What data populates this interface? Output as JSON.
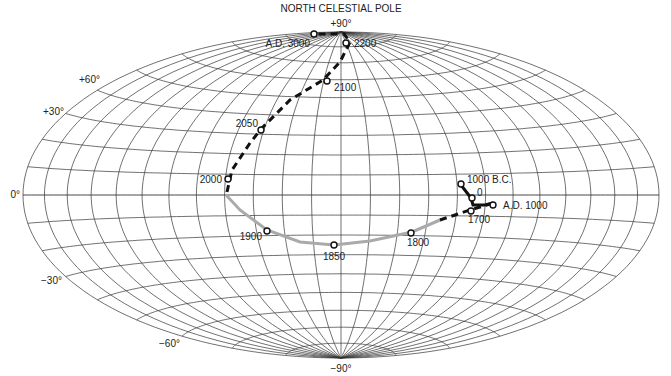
{
  "title": "NORTH CELESTIAL POLE",
  "projection": {
    "cx": 341,
    "cy": 195,
    "rx": 318,
    "ry": 163,
    "lat_step": 10,
    "lon_step": 15
  },
  "lat_labels": [
    {
      "text": "+90°",
      "x": 341,
      "y": 27,
      "anchor": "middle"
    },
    {
      "text": "+60°",
      "x": 100,
      "y": 83,
      "anchor": "end"
    },
    {
      "text": "+30°",
      "x": 64,
      "y": 115,
      "anchor": "end"
    },
    {
      "text": "0°",
      "x": 20,
      "y": 198,
      "anchor": "end"
    },
    {
      "text": "−30°",
      "x": 62,
      "y": 284,
      "anchor": "end"
    },
    {
      "text": "−60°",
      "x": 180,
      "y": 347,
      "anchor": "end"
    },
    {
      "text": "−90°",
      "x": 341,
      "y": 372,
      "anchor": "middle"
    }
  ],
  "path": {
    "gray_solid": [
      [
        227,
        196
      ],
      [
        240,
        210
      ],
      [
        267,
        230
      ],
      [
        300,
        242
      ],
      [
        334,
        245
      ],
      [
        370,
        241
      ],
      [
        412,
        232
      ],
      [
        440,
        220
      ]
    ],
    "dashed_lower": [
      [
        440,
        220
      ],
      [
        470,
        210
      ],
      [
        490,
        204
      ]
    ],
    "bc_segment": [
      [
        461,
        185
      ],
      [
        471,
        198
      ],
      [
        473,
        205
      ],
      [
        485,
        205
      ],
      [
        493,
        203
      ]
    ],
    "dashed_upper": [
      [
        227,
        192
      ],
      [
        232,
        170
      ],
      [
        250,
        143
      ],
      [
        262,
        128
      ],
      [
        290,
        100
      ],
      [
        323,
        80
      ],
      [
        340,
        62
      ],
      [
        350,
        42
      ],
      [
        344,
        34
      ],
      [
        333,
        34
      ],
      [
        316,
        34
      ]
    ]
  },
  "points": [
    {
      "label": "A.D. 3000",
      "x": 314,
      "y": 34,
      "lx": 310,
      "ly": 47,
      "anchor": "end",
      "fill": "#fff"
    },
    {
      "label": "2200",
      "x": 346,
      "y": 43,
      "lx": 354,
      "ly": 47,
      "anchor": "start",
      "fill": "#fff"
    },
    {
      "label": "2100",
      "x": 327,
      "y": 81,
      "lx": 334,
      "ly": 91,
      "anchor": "start",
      "fill": "#fff"
    },
    {
      "label": "2050",
      "x": 261,
      "y": 130,
      "lx": 258,
      "ly": 127,
      "anchor": "end",
      "fill": "#fff"
    },
    {
      "label": "2000",
      "x": 228,
      "y": 179,
      "lx": 222,
      "ly": 183,
      "anchor": "end",
      "fill": "#fff"
    },
    {
      "label": "1900",
      "x": 267,
      "y": 231,
      "lx": 262,
      "ly": 240,
      "anchor": "end",
      "fill": "#fff"
    },
    {
      "label": "1850",
      "x": 334,
      "y": 245,
      "lx": 334,
      "ly": 260,
      "anchor": "middle",
      "fill": "#fff"
    },
    {
      "label": "1800",
      "x": 411,
      "y": 233,
      "lx": 418,
      "ly": 246,
      "anchor": "middle",
      "fill": "#fff"
    },
    {
      "label": "1700",
      "x": 471,
      "y": 211,
      "lx": 479,
      "ly": 223,
      "anchor": "middle",
      "fill": "#fff"
    },
    {
      "label": "1000 B.C.",
      "x": 461,
      "y": 184,
      "lx": 467,
      "ly": 183,
      "anchor": "start",
      "fill": "#fff"
    },
    {
      "label": "0",
      "x": 472,
      "y": 198,
      "lx": 477,
      "ly": 196,
      "anchor": "start",
      "fill": "#fff"
    },
    {
      "label": "A.D. 1000",
      "x": 493,
      "y": 205,
      "lx": 503,
      "ly": 209,
      "anchor": "start",
      "fill": "#fff"
    }
  ],
  "colors": {
    "grid": "#333333",
    "gray_path": "#aaaaaa",
    "dash_path": "#111111"
  }
}
